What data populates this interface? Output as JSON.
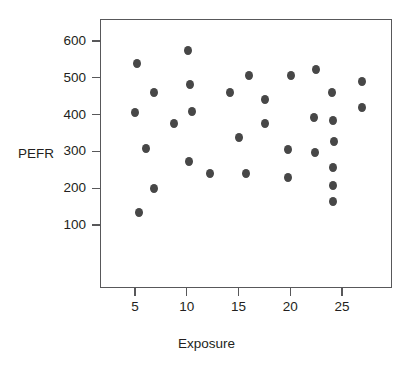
{
  "chart_data": {
    "type": "scatter",
    "title": "",
    "xlabel": "Exposure",
    "ylabel": "PEFR",
    "xlim": [
      2.6,
      30.8
    ],
    "ylim": [
      53,
      665
    ],
    "grid": false,
    "legend": null,
    "xticks": [
      5,
      10,
      15,
      20,
      25
    ],
    "xtick_labels": [
      "5",
      "10",
      "15",
      "20",
      "25"
    ],
    "yticks": [
      100,
      200,
      300,
      400,
      500,
      600
    ],
    "ytick_labels": [
      "100",
      "200",
      "300",
      "400",
      "500",
      "600"
    ],
    "marker": {
      "shape": "circle",
      "color": "#474747",
      "size": 8
    },
    "points": [
      {
        "x": 5.2,
        "y": 540
      },
      {
        "x": 5.0,
        "y": 407
      },
      {
        "x": 5.4,
        "y": 133
      },
      {
        "x": 6.1,
        "y": 307
      },
      {
        "x": 6.8,
        "y": 459
      },
      {
        "x": 6.8,
        "y": 199
      },
      {
        "x": 8.8,
        "y": 376
      },
      {
        "x": 10.1,
        "y": 573
      },
      {
        "x": 10.3,
        "y": 483
      },
      {
        "x": 10.5,
        "y": 408
      },
      {
        "x": 10.2,
        "y": 272
      },
      {
        "x": 12.2,
        "y": 239
      },
      {
        "x": 14.2,
        "y": 459
      },
      {
        "x": 15.0,
        "y": 338
      },
      {
        "x": 15.7,
        "y": 239
      },
      {
        "x": 16.0,
        "y": 507
      },
      {
        "x": 17.6,
        "y": 441
      },
      {
        "x": 17.6,
        "y": 376
      },
      {
        "x": 19.8,
        "y": 305
      },
      {
        "x": 19.8,
        "y": 228
      },
      {
        "x": 20.1,
        "y": 507
      },
      {
        "x": 22.3,
        "y": 393
      },
      {
        "x": 22.4,
        "y": 297
      },
      {
        "x": 22.5,
        "y": 522
      },
      {
        "x": 24.0,
        "y": 459
      },
      {
        "x": 24.1,
        "y": 384
      },
      {
        "x": 24.2,
        "y": 328
      },
      {
        "x": 24.1,
        "y": 256
      },
      {
        "x": 24.1,
        "y": 208
      },
      {
        "x": 24.1,
        "y": 163
      },
      {
        "x": 26.9,
        "y": 491
      },
      {
        "x": 26.9,
        "y": 418
      }
    ]
  }
}
